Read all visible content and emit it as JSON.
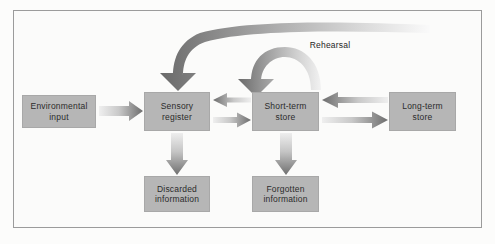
{
  "figure": {
    "frame_color": "#9b9b9b",
    "background_color": "#fbfbfa",
    "node_fill": "#b6b6b6",
    "arrow_dark": "#6f6f6f",
    "arrow_light": "#e6e6e6"
  },
  "nodes": {
    "environmental_input": "Environmental\ninput",
    "sensory_register": "Sensory\nregister",
    "short_term_store": "Short-term\nstore",
    "long_term_store": "Long-term\nstore",
    "discarded_information": "Discarded\ninformation",
    "forgotten_information": "Forgotten\ninformation"
  },
  "labels": {
    "rehearsal": "Rehearsal"
  },
  "chart_data": {
    "type": "diagram",
    "nodes": [
      {
        "id": "environmental_input",
        "label": "Environmental input",
        "x": 22,
        "y": 95,
        "w": 74,
        "h": 33
      },
      {
        "id": "sensory_register",
        "label": "Sensory register",
        "x": 144,
        "y": 92,
        "w": 66,
        "h": 39
      },
      {
        "id": "short_term_store",
        "label": "Short-term store",
        "x": 252,
        "y": 92,
        "w": 67,
        "h": 39
      },
      {
        "id": "long_term_store",
        "label": "Long-term store",
        "x": 389,
        "y": 92,
        "w": 67,
        "h": 39
      },
      {
        "id": "discarded_information",
        "label": "Discarded information",
        "x": 144,
        "y": 176,
        "w": 66,
        "h": 36
      },
      {
        "id": "forgotten_information",
        "label": "Forgotten information",
        "x": 252,
        "y": 176,
        "w": 67,
        "h": 36
      }
    ],
    "edges": [
      {
        "from": "environmental_input",
        "to": "sensory_register",
        "kind": "straight",
        "direction": "right",
        "label": ""
      },
      {
        "from": "short_term_store",
        "to": "sensory_register",
        "kind": "straight",
        "direction": "left",
        "label": ""
      },
      {
        "from": "sensory_register",
        "to": "short_term_store",
        "kind": "straight",
        "direction": "right",
        "label": ""
      },
      {
        "from": "long_term_store",
        "to": "short_term_store",
        "kind": "straight",
        "direction": "left",
        "label": ""
      },
      {
        "from": "short_term_store",
        "to": "long_term_store",
        "kind": "straight",
        "direction": "right",
        "label": ""
      },
      {
        "from": "sensory_register",
        "to": "discarded_information",
        "kind": "straight",
        "direction": "down",
        "label": ""
      },
      {
        "from": "short_term_store",
        "to": "forgotten_information",
        "kind": "straight",
        "direction": "down",
        "label": ""
      },
      {
        "from": "long_term_store",
        "to": "sensory_register",
        "kind": "arc-top",
        "direction": "down",
        "label": ""
      },
      {
        "from": "short_term_store",
        "to": "short_term_store",
        "kind": "loop",
        "direction": "down",
        "label": "Rehearsal"
      }
    ]
  }
}
